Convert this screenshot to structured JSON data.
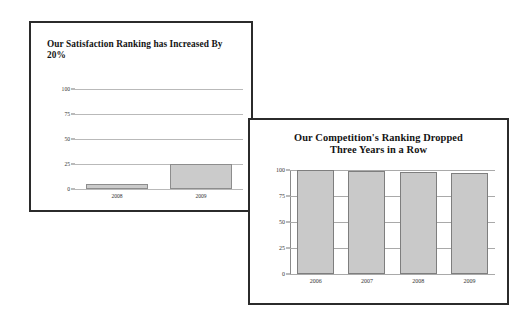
{
  "chart_data": [
    {
      "type": "bar",
      "title": "Our Satisfaction Ranking has Increased By 20%",
      "categories": [
        "2008",
        "2009"
      ],
      "values": [
        5,
        25
      ],
      "ticks": [
        "100",
        "75",
        "50",
        "25",
        "0"
      ],
      "tick_values": [
        100,
        75,
        50,
        25,
        0
      ],
      "xlabel": "",
      "ylabel": "",
      "ylim": [
        0,
        100
      ],
      "grid": true,
      "legend": "none",
      "bar_color": "#cbcbcb",
      "bar_border_color": "#8d8d8d"
    },
    {
      "type": "bar",
      "title_line_1": "Our Competition's Ranking Dropped",
      "title_line_2": "Three Years in a Row",
      "title": "Our Competition's Ranking Dropped Three Years in a Row",
      "categories": [
        "2006",
        "2007",
        "2008",
        "2009"
      ],
      "values": [
        100,
        99,
        98,
        97
      ],
      "ticks": [
        "100",
        "75",
        "50",
        "25",
        "0"
      ],
      "tick_values": [
        100,
        75,
        50,
        25,
        0
      ],
      "xlabel": "",
      "ylabel": "",
      "ylim": [
        0,
        100
      ],
      "grid": true,
      "legend": "none",
      "bar_color": "#c9c9c9",
      "bar_border_color": "#7e7e7e"
    }
  ],
  "panels": [
    {
      "name": "satisfaction-ranking-panel"
    },
    {
      "name": "competition-ranking-panel"
    }
  ],
  "colors": {
    "panel_border": "#2b2b2b",
    "background": "#ffffff",
    "gridline": "#b9b9b9",
    "text": "#141414"
  }
}
